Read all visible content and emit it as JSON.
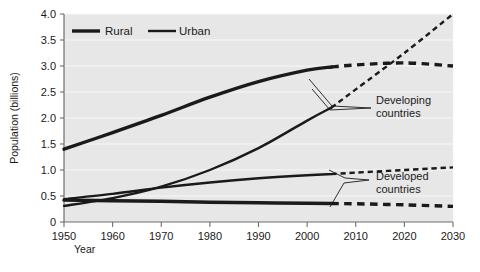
{
  "chart_data": {
    "type": "line",
    "title": "",
    "subtitle": "",
    "xlabel": "Year",
    "ylabel": "Population (billions)",
    "xlim": [
      1950,
      2030
    ],
    "ylim": [
      0,
      4.0
    ],
    "xticks": [
      1950,
      1960,
      1970,
      1980,
      1990,
      2000,
      2010,
      2020,
      2030
    ],
    "xtick_labels": [
      "1950",
      "1960",
      "1970",
      "1980",
      "1990",
      "2000",
      "2010",
      "2020",
      "2030"
    ],
    "yticks": [
      0,
      0.5,
      1.0,
      1.5,
      2.0,
      2.5,
      3.0,
      3.5,
      4.0
    ],
    "ytick_labels": [
      "0",
      "0.5",
      "1.0",
      "1.5",
      "2.0",
      "2.5",
      "3.0",
      "3.5",
      "4.0"
    ],
    "grid": "horizontal-white",
    "plot_background": "#e7e7e7",
    "page_background": "#ffffff",
    "line_color": "#1a1a1a",
    "historical_range": [
      1950,
      2005
    ],
    "projected_range": [
      2005,
      2030
    ],
    "projection_style": "dashed",
    "legend": {
      "position": "top-left-inside",
      "entries": [
        {
          "label": "Rural",
          "style": "thick-solid",
          "width_px": 3.4
        },
        {
          "label": "Urban",
          "style": "medium-solid",
          "width_px": 2.4
        }
      ]
    },
    "annotations": [
      {
        "label": "Developing countries",
        "lines": [
          "Developing",
          "countries"
        ],
        "x_px": 378,
        "y_px": 106,
        "points_to": [
          "developing-rural",
          "developing-urban"
        ]
      },
      {
        "label": "Developed countries",
        "lines": [
          "Developed",
          "countries"
        ],
        "x_px": 378,
        "y_px": 182,
        "points_to": [
          "developed-urban",
          "developed-rural"
        ]
      }
    ],
    "series": [
      {
        "name": "Developing countries rural",
        "key": "developing-rural",
        "group": "Developing countries",
        "type": "Rural",
        "x": [
          1950,
          1960,
          1970,
          1980,
          1990,
          2000,
          2005,
          2010,
          2020,
          2030
        ],
        "values": [
          1.4,
          1.72,
          2.05,
          2.4,
          2.7,
          2.92,
          2.98,
          3.02,
          3.06,
          3.0
        ],
        "x_hist": [
          1950,
          1960,
          1970,
          1980,
          1990,
          2000,
          2005
        ],
        "values_hist": [
          1.4,
          1.72,
          2.05,
          2.4,
          2.7,
          2.92,
          2.98
        ],
        "x_proj": [
          2005,
          2010,
          2020,
          2030
        ],
        "values_proj": [
          2.98,
          3.02,
          3.06,
          3.0
        ]
      },
      {
        "name": "Developing countries urban",
        "key": "developing-urban",
        "group": "Developing countries",
        "type": "Urban",
        "x": [
          1950,
          1960,
          1970,
          1980,
          1990,
          2000,
          2005,
          2010,
          2020,
          2030
        ],
        "values": [
          0.31,
          0.46,
          0.68,
          1.0,
          1.42,
          1.95,
          2.2,
          2.55,
          3.25,
          4.0
        ],
        "x_hist": [
          1950,
          1960,
          1970,
          1980,
          1990,
          2000,
          2005
        ],
        "values_hist": [
          0.31,
          0.46,
          0.68,
          1.0,
          1.42,
          1.95,
          2.2
        ],
        "x_proj": [
          2005,
          2010,
          2020,
          2030
        ],
        "values_proj": [
          2.2,
          2.55,
          3.25,
          4.0
        ]
      },
      {
        "name": "Developed countries urban",
        "key": "developed-urban",
        "group": "Developed countries",
        "type": "Urban",
        "x": [
          1950,
          1960,
          1970,
          1980,
          1990,
          2000,
          2005,
          2010,
          2020,
          2030
        ],
        "values": [
          0.44,
          0.54,
          0.66,
          0.76,
          0.84,
          0.9,
          0.92,
          0.95,
          1.0,
          1.05
        ],
        "x_hist": [
          1950,
          1960,
          1970,
          1980,
          1990,
          2000,
          2005
        ],
        "values_hist": [
          0.44,
          0.54,
          0.66,
          0.76,
          0.84,
          0.9,
          0.92
        ],
        "x_proj": [
          2005,
          2010,
          2020,
          2030
        ],
        "values_proj": [
          0.92,
          0.95,
          1.0,
          1.05
        ]
      },
      {
        "name": "Developed countries rural",
        "key": "developed-rural",
        "group": "Developed countries",
        "type": "Rural",
        "x": [
          1950,
          1960,
          1970,
          1980,
          1990,
          2000,
          2005,
          2010,
          2020,
          2030
        ],
        "values": [
          0.42,
          0.41,
          0.4,
          0.38,
          0.37,
          0.36,
          0.355,
          0.35,
          0.33,
          0.3
        ],
        "x_hist": [
          1950,
          1960,
          1970,
          1980,
          1990,
          2000,
          2005
        ],
        "values_hist": [
          0.42,
          0.41,
          0.4,
          0.38,
          0.37,
          0.36,
          0.355
        ],
        "x_proj": [
          2005,
          2010,
          2020,
          2030
        ],
        "values_proj": [
          0.355,
          0.35,
          0.33,
          0.3
        ]
      }
    ]
  }
}
